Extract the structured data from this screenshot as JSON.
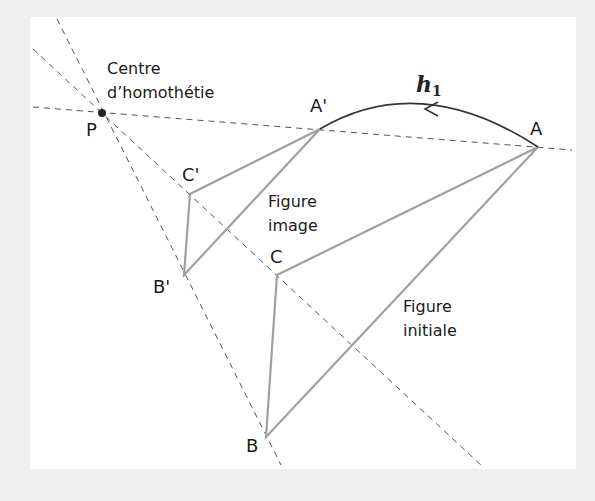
{
  "figure": {
    "centre_label": [
      "Centre",
      "d’homothétie"
    ],
    "transform_label": "h",
    "transform_subscript": "1",
    "image_figure_label": [
      "Figure",
      "image"
    ],
    "initial_figure_label": [
      "Figure",
      "initiale"
    ],
    "points": {
      "P": "P",
      "A": "A",
      "B": "B",
      "C": "C",
      "A_prime": "A'",
      "B_prime": "B'",
      "C_prime": "C'"
    }
  },
  "colors": {
    "background": "#efefef",
    "panel": "#ffffff",
    "triangle_stroke": "#a0a0a0",
    "dashed_stroke": "#555555",
    "arc_stroke": "#333333",
    "text": "#1a1a1a"
  },
  "geometry": {
    "centre": [
      102,
      113
    ],
    "ratio": 0.5,
    "initial_triangle": {
      "A": [
        538,
        147
      ],
      "B": [
        266,
        437
      ],
      "C": [
        277,
        275
      ]
    },
    "image_triangle": {
      "A_prime": [
        320,
        129
      ],
      "B_prime": [
        184,
        275
      ],
      "C_prime": [
        190,
        194
      ]
    }
  }
}
